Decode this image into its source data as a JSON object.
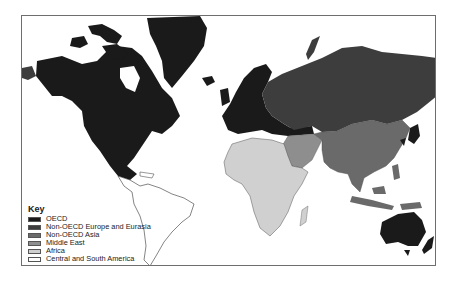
{
  "map": {
    "title": "World regions map",
    "colors": {
      "oecd": "#1a1a1a",
      "non_oecd_europe_eurasia": "#3d3d3d",
      "non_oecd_asia": "#6a6a6a",
      "middle_east": "#8e8e8e",
      "africa": "#d0d0d0",
      "central_south_america": "#ffffff",
      "border": "#6e6e6e"
    }
  },
  "legend": {
    "title": "Key",
    "items": [
      {
        "label": "OECD",
        "color": "#1a1a1a"
      },
      {
        "label": "Non-OECD Europe and Eurasia",
        "color": "#3d3d3d"
      },
      {
        "label": "Non-OECD Asia",
        "color": "#6a6a6a"
      },
      {
        "label": "Middle East",
        "color": "#8e8e8e"
      },
      {
        "label": "Africa",
        "color": "#d0d0d0"
      },
      {
        "label": "Central and South America",
        "color": "#ffffff"
      }
    ]
  }
}
